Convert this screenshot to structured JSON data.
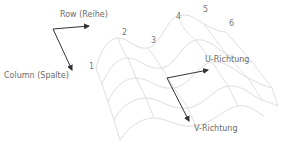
{
  "diagram": {
    "labels": {
      "row": "Row (Reihe)",
      "column": "Column (Spalte)",
      "u_direction": "U-Richtung",
      "v_direction": "V-Richtung"
    },
    "point_numbers": [
      "1",
      "2",
      "3",
      "4",
      "5",
      "6"
    ],
    "colors": {
      "mesh": "#d6d6d6",
      "arrow": "#333333",
      "text": "#6a6a6a"
    }
  }
}
